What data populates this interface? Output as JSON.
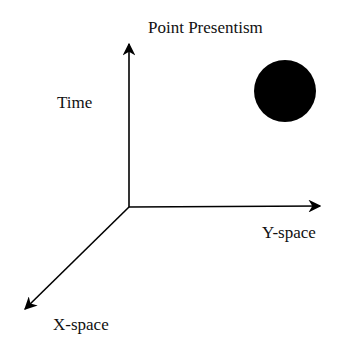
{
  "diagram": {
    "title": "Point Presentism",
    "axes": {
      "time": "Time",
      "y_space": "Y-space",
      "x_space": "X-space"
    },
    "point": {
      "shape": "filled-circle",
      "color": "#000000"
    }
  }
}
